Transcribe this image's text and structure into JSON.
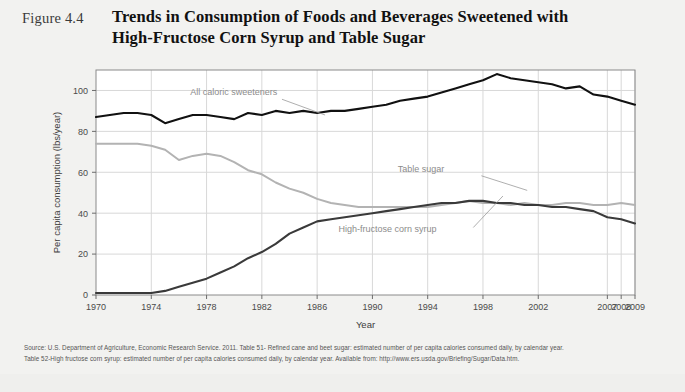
{
  "figure": {
    "number": "Figure 4.4",
    "title_line1": "Trends in Consumption of Foods and Beverages Sweetened with",
    "title_line2": "High-Fructose Corn Syrup and Table Sugar"
  },
  "source": {
    "line1": "Source: U.S. Department of Agriculture, Economic Research Service. 2011. Table 51- Refined cane and beet sugar: estimated number of per capita calories consumed daily, by calendar year.",
    "line2": "Table 52-High fructose corn syrup: estimated number of per capita calories consumed daily, by calendar year. Available from: http://www.ers.usda.gov/Briefing/Sugar/Data.htm."
  },
  "colors": {
    "background": "#f2f2f0",
    "plot_background": "#ffffff",
    "all_caloric_sweeteners": "#111111",
    "table_sugar": "#b3b3b3",
    "high_fructose_corn_syrup": "#3a3a3a",
    "gridline": "#d8d8d8",
    "frame": "#8a8a8a"
  },
  "chart_data": {
    "type": "line",
    "title": "Trends in Consumption of Foods and Beverages Sweetened with High-Fructose Corn Syrup and Table Sugar",
    "xlabel": "Year",
    "ylabel": "Per capita consumption (lbs/year)",
    "ylim": [
      0,
      110
    ],
    "yticks": [
      0,
      20,
      40,
      60,
      80,
      100
    ],
    "grid": true,
    "legend": "inline-annotations",
    "x_tick_labels": [
      "1970",
      "1974",
      "1978",
      "1982",
      "1986",
      "1990",
      "1994",
      "1998",
      "2002",
      "2007",
      "2008",
      "2009"
    ],
    "x_tick_index": [
      0,
      4,
      8,
      12,
      16,
      20,
      24,
      28,
      32,
      37,
      38,
      39
    ],
    "x": [
      1970,
      1971,
      1972,
      1973,
      1974,
      1975,
      1976,
      1977,
      1978,
      1979,
      1980,
      1981,
      1982,
      1983,
      1984,
      1985,
      1986,
      1987,
      1988,
      1989,
      1990,
      1991,
      1992,
      1993,
      1994,
      1995,
      1996,
      1997,
      1998,
      1999,
      2000,
      2001,
      2002,
      2003,
      2004,
      2005,
      2006,
      2007,
      2008,
      2009
    ],
    "series": [
      {
        "name": "All caloric sweeteners",
        "color": "#111111",
        "values": [
          87,
          88,
          89,
          89,
          88,
          84,
          86,
          88,
          88,
          87,
          86,
          89,
          88,
          90,
          89,
          90,
          89,
          90,
          90,
          91,
          92,
          93,
          95,
          96,
          97,
          99,
          101,
          103,
          105,
          108,
          106,
          105,
          104,
          103,
          101,
          102,
          98,
          97,
          95,
          93
        ]
      },
      {
        "name": "Table sugar",
        "color": "#b3b3b3",
        "values": [
          74,
          74,
          74,
          74,
          73,
          71,
          66,
          68,
          69,
          68,
          65,
          61,
          59,
          55,
          52,
          50,
          47,
          45,
          44,
          43,
          43,
          43,
          43,
          43,
          43,
          44,
          45,
          46,
          45,
          45,
          44,
          45,
          44,
          44,
          45,
          45,
          44,
          44,
          45,
          44
        ]
      },
      {
        "name": "High-fructose corn syrup",
        "color": "#3a3a3a",
        "values": [
          1,
          1,
          1,
          1,
          1,
          2,
          4,
          6,
          8,
          11,
          14,
          18,
          21,
          25,
          30,
          33,
          36,
          37,
          38,
          39,
          40,
          41,
          42,
          43,
          44,
          45,
          45,
          46,
          46,
          45,
          45,
          44,
          44,
          43,
          43,
          42,
          41,
          38,
          37,
          35
        ]
      }
    ],
    "annotations": [
      {
        "text": "All caloric sweeteners",
        "x_pct": 17.5,
        "y_pct": 11.0
      },
      {
        "text": "Table sugar",
        "x_pct": 56.0,
        "y_pct": 45.5
      },
      {
        "text": "High-fructose corn syrup",
        "x_pct": 45.0,
        "y_pct": 72.0
      }
    ]
  }
}
